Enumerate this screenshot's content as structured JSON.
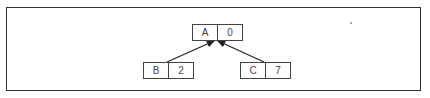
{
  "diagram": {
    "type": "tree",
    "nodes": [
      {
        "id": "A",
        "label": "A",
        "value": "0",
        "role": "root"
      },
      {
        "id": "B",
        "label": "B",
        "value": "2",
        "role": "child"
      },
      {
        "id": "C",
        "label": "C",
        "value": "7",
        "role": "child"
      }
    ],
    "edges": [
      {
        "from": "B",
        "to": "A",
        "arrow": "to"
      },
      {
        "from": "C",
        "to": "A",
        "arrow": "to"
      }
    ]
  }
}
